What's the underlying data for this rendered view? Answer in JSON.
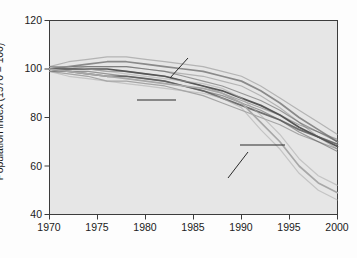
{
  "chart_data": {
    "type": "line",
    "title": "",
    "subtitle": "",
    "xlabel": "",
    "ylabel": "Population index (1970 = 100)",
    "xlim": [
      1970,
      2000
    ],
    "ylim": [
      40,
      120
    ],
    "xticks": [
      1970,
      1975,
      1980,
      1985,
      1990,
      1995,
      2000
    ],
    "yticks": [
      40,
      60,
      80,
      100,
      120
    ],
    "grid": false,
    "legend_position": "inline-annotations",
    "plot_background": "#e6e6e6",
    "band_style": "each series drawn as a confidence band of parallel lines",
    "annotations": [
      {
        "label": "Terrestrial vertebrate species",
        "series": "terrestrial"
      },
      {
        "label": "Marine vertebrate species",
        "series": "marine"
      },
      {
        "label": "All vertebrate species",
        "series": "all"
      },
      {
        "label": "Freshwater vertebrate species",
        "series": "freshwater"
      }
    ],
    "x": [
      1970,
      1972,
      1974,
      1976,
      1978,
      1980,
      1982,
      1984,
      1986,
      1988,
      1990,
      1992,
      1994,
      1996,
      1998,
      2000
    ],
    "series": [
      {
        "name": "Terrestrial vertebrate species",
        "color": "#8a8a8a",
        "values": [
          100,
          101,
          102,
          103,
          103,
          102,
          101,
          100,
          99,
          97,
          95,
          91,
          86,
          80,
          75,
          70
        ],
        "upper": [
          101,
          103,
          104,
          105,
          105,
          104,
          103,
          102,
          101,
          99,
          97,
          93,
          88,
          83,
          78,
          73
        ],
        "lower": [
          99,
          100,
          101,
          101,
          101,
          100,
          99,
          98,
          97,
          95,
          93,
          89,
          84,
          78,
          72,
          67
        ]
      },
      {
        "name": "Marine vertebrate species",
        "color": "#707070",
        "values": [
          100,
          99,
          98,
          97,
          97,
          96,
          95,
          93,
          91,
          88,
          85,
          82,
          79,
          75,
          72,
          69
        ],
        "upper": [
          101,
          100,
          100,
          99,
          99,
          98,
          97,
          95,
          93,
          90,
          87,
          84,
          81,
          77,
          74,
          71
        ],
        "lower": [
          99,
          98,
          97,
          95,
          95,
          94,
          93,
          91,
          89,
          86,
          83,
          80,
          77,
          73,
          70,
          67
        ]
      },
      {
        "name": "All vertebrate species",
        "color": "#555555",
        "values": [
          100,
          100,
          100,
          100,
          99,
          98,
          97,
          95,
          93,
          91,
          88,
          85,
          81,
          76,
          72,
          68
        ],
        "upper": [
          101,
          101,
          101,
          101,
          101,
          100,
          99,
          97,
          95,
          93,
          90,
          87,
          83,
          78,
          74,
          70
        ],
        "lower": [
          99,
          99,
          99,
          98,
          97,
          96,
          95,
          93,
          91,
          89,
          86,
          83,
          79,
          74,
          70,
          66
        ]
      },
      {
        "name": "Freshwater vertebrate species",
        "color": "#a8a8a8",
        "values": [
          100,
          99,
          98,
          97,
          96,
          95,
          94,
          93,
          92,
          90,
          86,
          78,
          70,
          60,
          53,
          49
        ],
        "upper": [
          101,
          101,
          100,
          99,
          98,
          97,
          96,
          95,
          94,
          92,
          88,
          81,
          73,
          63,
          56,
          52
        ],
        "lower": [
          99,
          97,
          96,
          95,
          94,
          93,
          92,
          91,
          90,
          88,
          84,
          75,
          67,
          57,
          50,
          46
        ]
      }
    ]
  },
  "axis": {
    "y_labels": [
      "120",
      "100",
      "80",
      "60",
      "40"
    ],
    "x_labels": [
      "1970",
      "1975",
      "1980",
      "1985",
      "1990",
      "1995",
      "2000"
    ],
    "y_title": "Population index (1970 = 100)"
  },
  "labels": {
    "terrestrial_line1": "Terrestrial vertebrate",
    "terrestrial_line2": "species",
    "marine_line1": "Marine vertebrate",
    "marine_line2": "species",
    "all_line1": "All vertebrate species",
    "freshwater_line1": "Freshwater vertebrate",
    "freshwater_line2": "species"
  }
}
